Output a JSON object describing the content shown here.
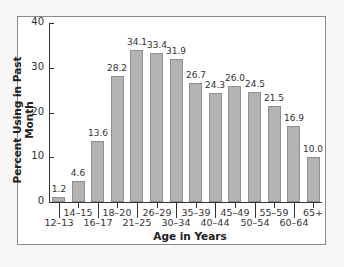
{
  "chart_data": {
    "type": "bar",
    "title": "",
    "xlabel": "Age in Years",
    "ylabel": "Percent Using in Past Month",
    "ylim": [
      0,
      40
    ],
    "yticks": [
      "0",
      "10",
      "20",
      "30",
      "40"
    ],
    "grid": false,
    "categories": [
      "12–13",
      "14–15",
      "16–17",
      "18–20",
      "21–25",
      "26–29",
      "30–34",
      "35–39",
      "40–44",
      "45–49",
      "50–54",
      "55–59",
      "60–64",
      "65+"
    ],
    "values": [
      1.2,
      4.6,
      13.6,
      28.2,
      34.1,
      33.4,
      31.9,
      26.7,
      24.3,
      26.0,
      24.5,
      21.5,
      16.9,
      10.0
    ],
    "value_labels": [
      "1.2",
      "4.6",
      "13.6",
      "28.2",
      "34.1",
      "33.4",
      "31.9",
      "26.7",
      "24.3",
      "26.0",
      "24.5",
      "21.5",
      "16.9",
      "10.0"
    ],
    "bar_color": "#b3b3b3"
  }
}
